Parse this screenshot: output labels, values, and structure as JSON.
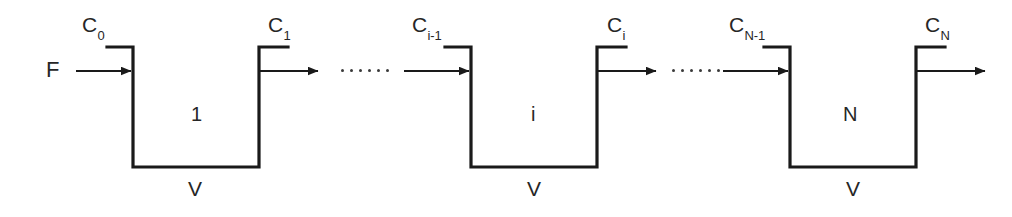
{
  "figure": {
    "type": "process-flow-diagram",
    "stroke_color": "#1a1a1a",
    "background_color": "#ffffff"
  },
  "feed": {
    "flow_label": "F"
  },
  "streams": [
    {
      "id": "c0",
      "label": "C",
      "subscript": "0"
    },
    {
      "id": "c1",
      "label": "C",
      "subscript": "1"
    },
    {
      "id": "ci_minus_1",
      "label": "C",
      "subscript": "i-1"
    },
    {
      "id": "ci",
      "label": "C",
      "subscript": "i"
    },
    {
      "id": "cn_minus_1",
      "label": "C",
      "subscript": "N-1"
    },
    {
      "id": "cn",
      "label": "C",
      "subscript": "N"
    }
  ],
  "tanks": [
    {
      "id": "tank-1",
      "stage_label": "1",
      "volume_label": "V",
      "inlet_stream": "c0",
      "outlet_stream": "c1"
    },
    {
      "id": "tank-i",
      "stage_label": "i",
      "volume_label": "V",
      "inlet_stream": "ci_minus_1",
      "outlet_stream": "ci"
    },
    {
      "id": "tank-n",
      "stage_label": "N",
      "volume_label": "V",
      "inlet_stream": "cn_minus_1",
      "outlet_stream": "cn"
    }
  ],
  "ellipses": [
    {
      "id": "ellipsis-1",
      "dots": 6
    },
    {
      "id": "ellipsis-2",
      "dots": 6
    }
  ]
}
